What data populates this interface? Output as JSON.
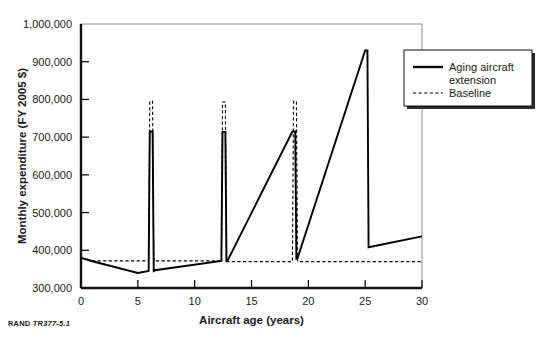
{
  "figure": {
    "source_note_brand": "RAND",
    "source_note_id": "TR377-5.1"
  },
  "chart_data": {
    "type": "line",
    "title": "",
    "xlabel": "Aircraft age (years)",
    "ylabel": "Monthly expenditure (FY 2005 $)",
    "xlim": [
      0,
      30
    ],
    "ylim": [
      300000,
      1000000
    ],
    "xticks": [
      0,
      5,
      10,
      15,
      20,
      25,
      30
    ],
    "xtick_labels": [
      "0",
      "5",
      "10",
      "15",
      "20",
      "25",
      "30"
    ],
    "yticks": [
      300000,
      400000,
      500000,
      600000,
      700000,
      800000,
      900000,
      1000000
    ],
    "ytick_labels": [
      "300,000",
      "400,000",
      "500,000",
      "600,000",
      "700,000",
      "800,000",
      "900,000",
      "1,000,000"
    ],
    "grid": false,
    "legend_position": "right-outside-top",
    "series": [
      {
        "name": "Aging aircraft extension",
        "style": "solid",
        "color": "#000000",
        "points": [
          [
            0.0,
            380000
          ],
          [
            1.0,
            371000
          ],
          [
            5.0,
            340000
          ],
          [
            5.95,
            345000
          ],
          [
            6.05,
            715000
          ],
          [
            6.3,
            715000
          ],
          [
            6.4,
            345000
          ],
          [
            6.5,
            347000
          ],
          [
            12.35,
            372000
          ],
          [
            12.45,
            714000
          ],
          [
            12.7,
            714000
          ],
          [
            12.8,
            372000
          ],
          [
            12.9,
            373000
          ],
          [
            18.6,
            715000
          ],
          [
            18.85,
            715000
          ],
          [
            18.95,
            378000
          ],
          [
            19.05,
            379000
          ],
          [
            25.0,
            930000
          ],
          [
            25.2,
            930000
          ],
          [
            25.3,
            408000
          ],
          [
            30.0,
            437000
          ]
        ]
      },
      {
        "name": "Baseline",
        "style": "dashed",
        "color": "#000000",
        "points": [
          [
            0.0,
            380000
          ],
          [
            1.2,
            372000
          ],
          [
            5.95,
            372000
          ],
          [
            6.05,
            795000
          ],
          [
            6.3,
            795000
          ],
          [
            6.4,
            372000
          ],
          [
            12.35,
            372000
          ],
          [
            12.45,
            793000
          ],
          [
            12.7,
            793000
          ],
          [
            12.8,
            370000
          ],
          [
            18.6,
            370000
          ],
          [
            18.7,
            795000
          ],
          [
            18.95,
            795000
          ],
          [
            19.05,
            370000
          ],
          [
            25.0,
            370000
          ],
          [
            25.1,
            370000
          ],
          [
            25.2,
            370000
          ],
          [
            30.0,
            370000
          ]
        ]
      }
    ],
    "legend_entries": [
      {
        "label_line1": "Aging aircraft",
        "label_line2": "extension",
        "style": "solid"
      },
      {
        "label_line1": "Baseline",
        "label_line2": "",
        "style": "dashed"
      }
    ]
  }
}
